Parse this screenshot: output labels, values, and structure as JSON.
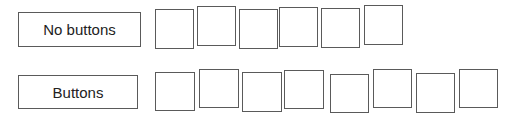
{
  "rows": [
    {
      "label": "No buttons",
      "label_box": {
        "x": 18,
        "y": 12,
        "w": 123,
        "h": 35
      },
      "squares": [
        {
          "x": 155,
          "y": 9,
          "w": 39,
          "h": 40
        },
        {
          "x": 197,
          "y": 6,
          "w": 39,
          "h": 40
        },
        {
          "x": 239,
          "y": 9,
          "w": 39,
          "h": 40
        },
        {
          "x": 279,
          "y": 7,
          "w": 39,
          "h": 40
        },
        {
          "x": 321,
          "y": 8,
          "w": 39,
          "h": 40
        },
        {
          "x": 364,
          "y": 5,
          "w": 39,
          "h": 40
        }
      ]
    },
    {
      "label": "Buttons",
      "label_box": {
        "x": 18,
        "y": 75,
        "w": 120,
        "h": 34
      },
      "squares": [
        {
          "x": 155,
          "y": 72,
          "w": 40,
          "h": 39
        },
        {
          "x": 199,
          "y": 69,
          "w": 40,
          "h": 39
        },
        {
          "x": 242,
          "y": 72,
          "w": 40,
          "h": 40
        },
        {
          "x": 284,
          "y": 70,
          "w": 40,
          "h": 39
        },
        {
          "x": 330,
          "y": 74,
          "w": 39,
          "h": 39
        },
        {
          "x": 373,
          "y": 69,
          "w": 39,
          "h": 39
        },
        {
          "x": 416,
          "y": 73,
          "w": 39,
          "h": 40
        },
        {
          "x": 459,
          "y": 69,
          "w": 39,
          "h": 39
        }
      ]
    }
  ]
}
